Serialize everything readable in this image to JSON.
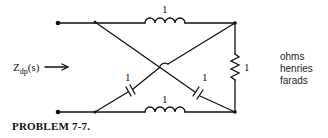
{
  "diagram": {
    "type": "circuit",
    "input_label": {
      "main": "Z",
      "sub": "dp",
      "arg": "(s)"
    },
    "input_arrow": "→",
    "components": [
      {
        "id": "L1",
        "kind": "inductor",
        "position": "top",
        "value": "1"
      },
      {
        "id": "L2",
        "kind": "inductor",
        "position": "bottom",
        "value": "1"
      },
      {
        "id": "R1",
        "kind": "resistor",
        "position": "right",
        "value": "1"
      },
      {
        "id": "C1",
        "kind": "capacitor",
        "position": "left-diagonal",
        "value": "1"
      },
      {
        "id": "C2",
        "kind": "capacitor",
        "position": "right-diagonal",
        "value": "1"
      }
    ],
    "units": [
      "ohms",
      "henries",
      "farads"
    ],
    "caption": "PROBLEM 7-7."
  }
}
